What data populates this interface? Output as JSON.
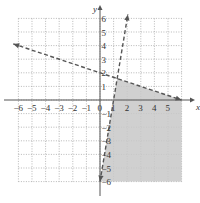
{
  "chart_data": {
    "type": "line",
    "title": "",
    "xlabel": "x",
    "ylabel": "y",
    "xlim": [
      -6,
      6
    ],
    "ylim": [
      -6,
      6
    ],
    "grid": true,
    "x_ticks": [
      "-6",
      "-5",
      "-4",
      "-3",
      "-2",
      "-1",
      "0",
      "1",
      "2",
      "3",
      "4",
      "5"
    ],
    "y_ticks": [
      "6",
      "5",
      "4",
      "3",
      "2",
      "1",
      "-1",
      "-2",
      "-3",
      "-4",
      "-5",
      "-6"
    ],
    "series": [
      {
        "name": "boundary-1",
        "equation": "y = -x/3 + 2",
        "style": "dashed",
        "points": [
          [
            -6,
            4
          ],
          [
            6,
            0
          ]
        ]
      },
      {
        "name": "boundary-2",
        "equation": "y = 6x - 6",
        "style": "dashed",
        "points": [
          [
            0,
            -6
          ],
          [
            2,
            6
          ]
        ]
      }
    ],
    "shaded_region": {
      "description": "below y = -x/3 + 2 and right of y = 6x - 6, within grid",
      "vertices": [
        [
          0,
          -6
        ],
        [
          1.26,
          1.58
        ],
        [
          6,
          0
        ],
        [
          6,
          -6
        ]
      ]
    }
  }
}
